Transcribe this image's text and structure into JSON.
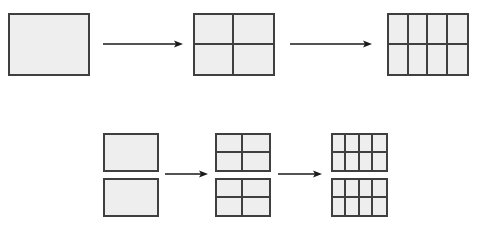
{
  "canvas": {
    "width": 483,
    "height": 228,
    "background": "#ffffff"
  },
  "style": {
    "fill_color": "#eeeeee",
    "stroke_color": "#3f3f3f",
    "stroke_width": 2,
    "arrow_color": "#1a1a1a"
  },
  "diagram": {
    "type": "area-partition-sequence",
    "rows": [
      {
        "name": "single-rectangle-row",
        "steps": [
          {
            "name": "step-1-whole",
            "label": "",
            "figures": [
              {
                "name": "rectangle-whole",
                "cols": 1,
                "rows": 1,
                "cells": 1,
                "x": 8,
                "y": 13,
                "width": 82,
                "height": 63
              }
            ]
          },
          {
            "name": "step-2-halved-both-ways",
            "label": "",
            "figures": [
              {
                "name": "rectangle-2x2",
                "cols": 2,
                "rows": 2,
                "cells": 4,
                "x": 193,
                "y": 13,
                "width": 82,
                "height": 63
              }
            ]
          },
          {
            "name": "step-3-quartered-columns",
            "label": "",
            "figures": [
              {
                "name": "rectangle-4x2",
                "cols": 4,
                "rows": 2,
                "cells": 8,
                "x": 387,
                "y": 13,
                "width": 82,
                "height": 63
              }
            ]
          }
        ],
        "arrows": [
          {
            "name": "arrow-row1-step1-to-step2",
            "x1": 103,
            "y1": 44,
            "x2": 183,
            "y2": 44
          },
          {
            "name": "arrow-row1-step2-to-step3",
            "x1": 290,
            "y1": 44,
            "x2": 372,
            "y2": 44
          }
        ]
      },
      {
        "name": "stacked-rectangles-row",
        "steps": [
          {
            "name": "step-1-two-wholes",
            "label": "",
            "figures": [
              {
                "name": "rectangle-whole-top",
                "cols": 1,
                "rows": 1,
                "cells": 1,
                "x": 103,
                "y": 133,
                "width": 56,
                "height": 39
              },
              {
                "name": "rectangle-whole-bottom",
                "cols": 1,
                "rows": 1,
                "cells": 1,
                "x": 103,
                "y": 178,
                "width": 56,
                "height": 39
              }
            ]
          },
          {
            "name": "step-2-two-2x2",
            "label": "",
            "figures": [
              {
                "name": "rectangle-2x2-top",
                "cols": 2,
                "rows": 2,
                "cells": 4,
                "x": 215,
                "y": 133,
                "width": 56,
                "height": 39
              },
              {
                "name": "rectangle-2x2-bottom",
                "cols": 2,
                "rows": 2,
                "cells": 4,
                "x": 215,
                "y": 178,
                "width": 56,
                "height": 39
              }
            ]
          },
          {
            "name": "step-3-two-4x2",
            "label": "",
            "figures": [
              {
                "name": "rectangle-4x2-top",
                "cols": 4,
                "rows": 2,
                "cells": 8,
                "x": 331,
                "y": 133,
                "width": 57,
                "height": 39
              },
              {
                "name": "rectangle-4x2-bottom",
                "cols": 4,
                "rows": 2,
                "cells": 8,
                "x": 331,
                "y": 178,
                "width": 57,
                "height": 39
              }
            ]
          }
        ],
        "arrows": [
          {
            "name": "arrow-row2-step1-to-step2",
            "x1": 165,
            "y1": 174,
            "x2": 208,
            "y2": 174
          },
          {
            "name": "arrow-row2-step2-to-step3",
            "x1": 278,
            "y1": 174,
            "x2": 322,
            "y2": 174
          }
        ]
      }
    ]
  }
}
